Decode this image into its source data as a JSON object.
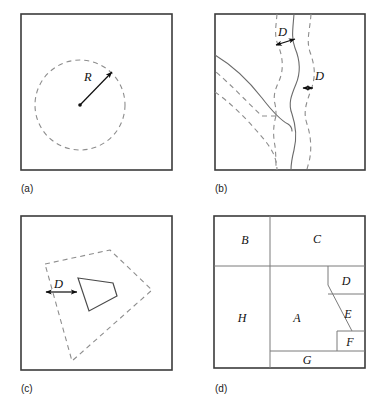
{
  "figure": {
    "width": 385,
    "height": 404,
    "background": "#ffffff",
    "colors": {
      "frame": "#3b3b3b",
      "dashed_buffer": "#8d8d8d",
      "solid_feature": "#6b6b6b",
      "arrow": "#0d0d0d",
      "region_divider": "#7a7a7a",
      "label_text": "#111111"
    }
  },
  "panels": [
    {
      "key": "a",
      "caption": "(a)",
      "caption_x": 21,
      "caption_y": 192,
      "frame": {
        "x": 21,
        "y": 14,
        "w": 151,
        "h": 156
      },
      "type": "point-buffer",
      "circle": {
        "cx": 80,
        "cy": 105,
        "r": 45
      },
      "center_dot": {
        "cx": 80,
        "cy": 105,
        "r": 1.8
      },
      "radius_arrow": {
        "x1": 80,
        "y1": 105,
        "x2": 113,
        "y2": 71
      },
      "labels": [
        {
          "text": "R",
          "x": 84,
          "y": 81
        }
      ]
    },
    {
      "key": "b",
      "caption": "(b)",
      "caption_x": 215,
      "caption_y": 192,
      "frame": {
        "x": 215,
        "y": 14,
        "w": 150,
        "h": 156
      },
      "type": "line-buffer",
      "labels": [
        {
          "text": "D",
          "x": 283,
          "y": 34
        },
        {
          "text": "D",
          "x": 322,
          "y": 80
        }
      ],
      "measure_arrows": [
        {
          "x1": 276,
          "y1": 44,
          "x2": 294,
          "y2": 38
        },
        {
          "x1": 313,
          "y1": 88,
          "x2": 334,
          "y2": 88
        }
      ]
    },
    {
      "key": "c",
      "caption": "(c)",
      "caption_x": 21,
      "caption_y": 392,
      "frame": {
        "x": 21,
        "y": 216,
        "w": 151,
        "h": 154
      },
      "type": "polygon-buffer",
      "inner_polygon": [
        [
          78,
          278
        ],
        [
          113,
          283
        ],
        [
          117,
          296
        ],
        [
          89,
          311
        ]
      ],
      "buffer_polygon": [
        [
          45,
          264
        ],
        [
          110,
          250
        ],
        [
          152,
          290
        ],
        [
          72,
          361
        ]
      ],
      "measure_arrow": {
        "x1": 45,
        "y1": 292,
        "x2": 78,
        "y2": 292
      },
      "labels": [
        {
          "text": "D",
          "x": 57,
          "y": 287
        }
      ]
    },
    {
      "key": "d",
      "caption": "(d)",
      "caption_x": 215,
      "caption_y": 392,
      "frame": {
        "x": 214,
        "y": 216,
        "w": 151,
        "h": 152
      },
      "type": "polygon-adjacency",
      "regions": [
        {
          "id": "A",
          "label": "A",
          "cx": 297,
          "cy": 318
        },
        {
          "id": "B",
          "label": "B",
          "cx": 245,
          "cy": 240
        },
        {
          "id": "C",
          "label": "C",
          "cx": 317,
          "cy": 239
        },
        {
          "id": "D",
          "label": "D",
          "cx": 344,
          "cy": 281
        },
        {
          "id": "E",
          "label": "E",
          "cx": 345,
          "cy": 318
        },
        {
          "id": "F",
          "label": "F",
          "cx": 347,
          "cy": 345
        },
        {
          "id": "G",
          "label": "G",
          "cx": 303,
          "cy": 360
        },
        {
          "id": "H",
          "label": "H",
          "cx": 243,
          "cy": 318
        }
      ]
    }
  ]
}
